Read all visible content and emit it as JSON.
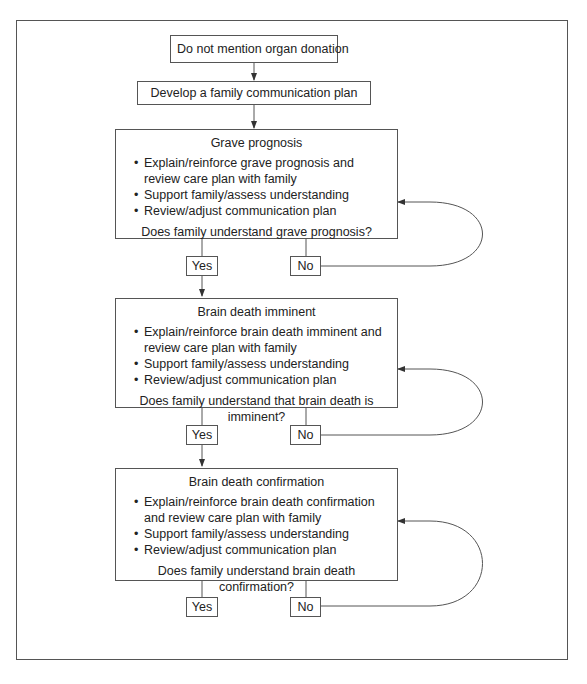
{
  "diagram": {
    "type": "flowchart",
    "start_box": "Do not mention organ donation",
    "plan_box": "Develop a family communication plan",
    "stages": [
      {
        "title": "Grave prognosis",
        "bullets": [
          "Explain/reinforce grave prognosis and review care plan with family",
          "Support family/assess understanding",
          "Review/adjust communication plan"
        ],
        "question": "Does family understand grave prognosis?",
        "yes": "Yes",
        "no": "No"
      },
      {
        "title": "Brain death imminent",
        "bullets": [
          "Explain/reinforce brain death imminent and review care plan with family",
          "Support family/assess understanding",
          "Review/adjust communication plan"
        ],
        "question": "Does family understand that brain death is imminent?",
        "yes": "Yes",
        "no": "No"
      },
      {
        "title": "Brain death confirmation",
        "bullets": [
          "Explain/reinforce brain death confirmation and review care plan with family",
          "Support family/assess understanding",
          "Review/adjust communication plan"
        ],
        "question": "Does family understand brain death confirmation?",
        "yes": "Yes",
        "no": "No"
      }
    ],
    "edges": [
      {
        "from": "start_box",
        "to": "plan_box"
      },
      {
        "from": "plan_box",
        "to": "stage_0"
      },
      {
        "from": "stage_0",
        "to": "yes_0"
      },
      {
        "from": "stage_0",
        "to": "no_0"
      },
      {
        "from": "no_0",
        "to": "stage_0",
        "style": "loop-back"
      },
      {
        "from": "yes_0",
        "to": "stage_1"
      },
      {
        "from": "stage_1",
        "to": "yes_1"
      },
      {
        "from": "stage_1",
        "to": "no_1"
      },
      {
        "from": "no_1",
        "to": "stage_1",
        "style": "loop-back"
      },
      {
        "from": "yes_1",
        "to": "stage_2"
      },
      {
        "from": "stage_2",
        "to": "yes_2"
      },
      {
        "from": "stage_2",
        "to": "no_2"
      },
      {
        "from": "no_2",
        "to": "stage_2",
        "style": "loop-back"
      }
    ]
  }
}
